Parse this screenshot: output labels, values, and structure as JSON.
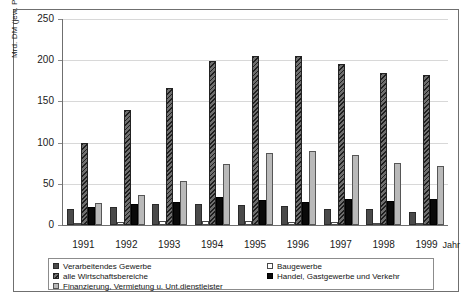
{
  "chart_data": {
    "type": "bar",
    "title": "",
    "xlabel": "Jahr",
    "ylabel": "Mrd. DM (jew. Preise)",
    "categories": [
      "1991",
      "1992",
      "1993",
      "1994",
      "1995",
      "1996",
      "1997",
      "1998",
      "1999"
    ],
    "ylim": [
      0,
      250
    ],
    "yticks": [
      0,
      50,
      100,
      150,
      200,
      250
    ],
    "grid": true,
    "legend_position": "below-axis",
    "series": [
      {
        "name": "Verarbeitendes Gewerbe",
        "swatch": "dark-speckle",
        "values": [
          20,
          22,
          25,
          26,
          24,
          23,
          20,
          19,
          16
        ]
      },
      {
        "name": "Baugewerbe",
        "swatch": "white-open",
        "values": [
          3,
          4,
          5,
          5,
          5,
          4,
          4,
          3,
          3
        ]
      },
      {
        "name": "alle Wirtschaftsbereiche",
        "swatch": "diagonal-hatch",
        "values": [
          100,
          139,
          166,
          199,
          205,
          205,
          196,
          184,
          182
        ]
      },
      {
        "name": "Handel, Gastgewerbe und Verkehr",
        "swatch": "solid-black",
        "values": [
          22,
          25,
          28,
          34,
          30,
          28,
          31,
          29,
          31
        ]
      },
      {
        "name": "Finanzierung, Vermietung u. Unt.dienstleister",
        "swatch": "light-stipple",
        "values": [
          27,
          36,
          53,
          74,
          87,
          90,
          85,
          75,
          72
        ]
      }
    ]
  },
  "axis": {
    "y_label": "Mrd. DM (jew. Preise)",
    "x_label": "Jahr",
    "y_ticks": [
      "250",
      "200",
      "150",
      "100",
      "50",
      "0"
    ],
    "x_ticks": [
      "1991",
      "1992",
      "1993",
      "1994",
      "1995",
      "1996",
      "1997",
      "1998",
      "1999"
    ]
  },
  "legend": {
    "rows": [
      {
        "left": "Verarbeitendes Gewerbe",
        "right": "Baugewerbe"
      },
      {
        "left": "alle Wirtschaftsbereiche",
        "right": "Handel, Gastgewerbe und Verkehr"
      },
      {
        "left": "Finanzierung, Vermietung u. Unt.dienstleister",
        "right": ""
      }
    ]
  },
  "colors": {
    "frame": "#6f6f6f",
    "grid": "#d8d8d8",
    "series_dark": "#4a4a4a",
    "series_hatch": "#555555",
    "series_black": "#0a0a0a",
    "series_light": "#b9b9b9",
    "text": "#1a1a1a"
  }
}
